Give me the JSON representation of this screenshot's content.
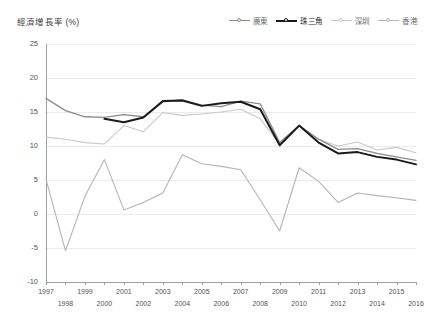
{
  "axis_title": "經濟增長率 (%)",
  "legend": {
    "items": [
      {
        "label": "廣東",
        "color": "#8c8c8c",
        "width": 1.3
      },
      {
        "label": "珠三角",
        "color": "#1a1a1a",
        "width": 2.0
      },
      {
        "label": "深圳",
        "color": "#c9c9c9",
        "width": 1.1
      },
      {
        "label": "香港",
        "color": "#b4b4b4",
        "width": 1.1
      }
    ]
  },
  "chart_data": {
    "type": "line",
    "title": "經濟增長率 (%)",
    "xlabel": "",
    "ylabel": "經濟增長率 (%)",
    "x": [
      1997,
      1998,
      1999,
      2000,
      2001,
      2002,
      2003,
      2004,
      2005,
      2006,
      2007,
      2008,
      2009,
      2010,
      2011,
      2012,
      2013,
      2014,
      2015,
      2016
    ],
    "xlim": [
      1997,
      2016
    ],
    "ylim": [
      -10,
      25
    ],
    "yticks": [
      -10,
      -5,
      0,
      5,
      10,
      15,
      20,
      25
    ],
    "xticks": [
      1997,
      1998,
      1999,
      2000,
      2001,
      2002,
      2003,
      2004,
      2005,
      2006,
      2007,
      2008,
      2009,
      2010,
      2011,
      2012,
      2013,
      2014,
      2015,
      2016
    ],
    "grid": true,
    "legend_position": "top-right",
    "series": [
      {
        "name": "廣東",
        "color": "#8c8c8c",
        "values": [
          17.0,
          15.2,
          14.3,
          14.2,
          14.6,
          14.3,
          16.5,
          16.8,
          16.0,
          15.8,
          16.6,
          16.2,
          10.5,
          13.0,
          11.0,
          9.5,
          9.6,
          8.9,
          8.4,
          7.9
        ]
      },
      {
        "name": "珠三角",
        "color": "#1a1a1a",
        "values": [
          null,
          null,
          null,
          14.0,
          13.5,
          14.2,
          16.6,
          16.7,
          15.9,
          16.3,
          16.5,
          15.4,
          10.1,
          13.0,
          10.5,
          8.9,
          9.1,
          8.4,
          8.0,
          7.3
        ]
      },
      {
        "name": "深圳",
        "color": "#c9c9c9",
        "values": [
          11.3,
          11.0,
          10.5,
          10.3,
          13.0,
          12.1,
          14.9,
          14.5,
          14.7,
          15.0,
          15.4,
          14.0,
          10.3,
          13.0,
          11.0,
          10.0,
          10.6,
          9.4,
          9.8,
          9.0
        ]
      },
      {
        "name": "香港",
        "color": "#b4b4b4",
        "values": [
          5.1,
          -5.4,
          2.6,
          8.0,
          0.6,
          1.7,
          3.1,
          8.7,
          7.4,
          7.0,
          6.5,
          2.1,
          -2.5,
          6.8,
          4.8,
          1.7,
          3.1,
          2.7,
          2.4,
          2.0
        ]
      }
    ]
  }
}
